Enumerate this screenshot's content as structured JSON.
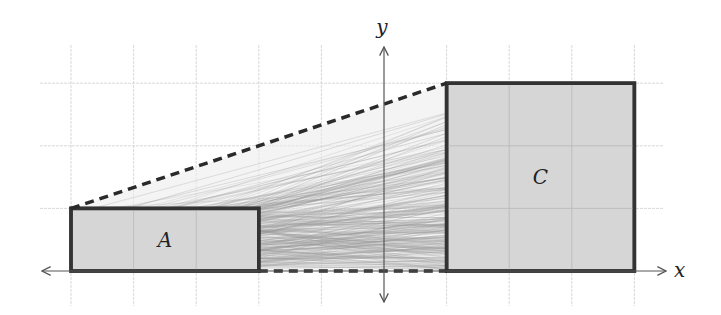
{
  "diagram": {
    "type": "coordinate-diagram",
    "axes": {
      "x_label": "x",
      "y_label": "y",
      "x_range": [
        -5.5,
        4.5
      ],
      "y_range": [
        -0.5,
        3.6
      ],
      "grid": true,
      "grid_step": 1
    },
    "shapes": [
      {
        "id": "A",
        "label": "A",
        "kind": "rectangle",
        "x": [
          -5,
          -2
        ],
        "y": [
          0,
          1
        ],
        "fill": "#d6d6d6",
        "stroke": "#333333"
      },
      {
        "id": "C",
        "label": "C",
        "kind": "rectangle",
        "x": [
          1,
          4
        ],
        "y": [
          0,
          3
        ],
        "fill": "#d6d6d6",
        "stroke": "#333333"
      }
    ],
    "dashed_lines": [
      {
        "from": [
          -5,
          1
        ],
        "to": [
          1,
          3
        ]
      },
      {
        "from": [
          -2,
          0
        ],
        "to": [
          1,
          0
        ]
      }
    ],
    "transport_lines": {
      "description": "many thin gray lines mapping region A to region C",
      "color": "#9a9a9a"
    }
  },
  "colors": {
    "grid": "#cfcfcf",
    "axis": "#555555",
    "shape_fill": "#d6d6d6",
    "shape_stroke": "#333333",
    "dash": "#2a2a2a"
  }
}
